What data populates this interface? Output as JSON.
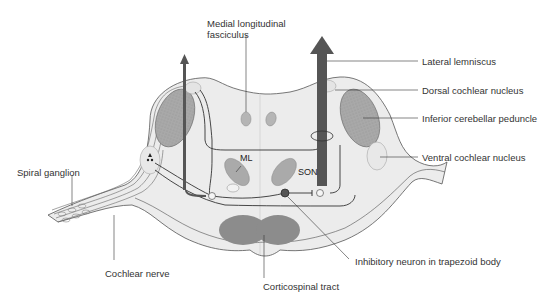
{
  "diagram": {
    "type": "anatomical cross-section"
  },
  "labels": {
    "medial_longitudinal_fasciculus_line1": "Medial longitudinal",
    "medial_longitudinal_fasciculus_line2": "fasciculus",
    "lateral_lemniscus": "Lateral lemniscus",
    "dorsal_cochlear_nucleus": "Dorsal cochlear nucleus",
    "inferior_cerebellar_peduncle": "Inferior cerebellar peduncle",
    "ventral_cochlear_nucleus": "Ventral cochlear nucleus",
    "spiral_ganglion": "Spiral ganglion",
    "cochlear_nerve": "Cochlear nerve",
    "corticospinal_tract": "Corticospinal tract",
    "inhibitory_neuron": "Inhibitory neuron in trapezoid body"
  },
  "inline_labels": {
    "ml": "ML",
    "son": "SON"
  },
  "colors": {
    "tissue_fill": "#ececec",
    "tissue_outline": "#555555",
    "peduncle_fill": "#a8a8a8",
    "tract_fill": "#8a8a8a",
    "arrow_fill": "#555555",
    "nucleus_fill": "#e4e4e4",
    "text": "#333333"
  }
}
